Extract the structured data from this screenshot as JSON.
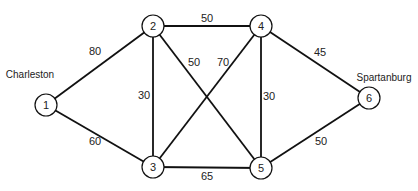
{
  "diagram": {
    "type": "weighted-undirected-graph",
    "nodes": [
      {
        "id": "1",
        "label": "1",
        "x": 46,
        "y": 105,
        "city": "Charleston",
        "city_x": 30,
        "city_y": 74
      },
      {
        "id": "2",
        "label": "2",
        "x": 153,
        "y": 26
      },
      {
        "id": "3",
        "label": "3",
        "x": 153,
        "y": 167
      },
      {
        "id": "4",
        "label": "4",
        "x": 261,
        "y": 26
      },
      {
        "id": "5",
        "label": "5",
        "x": 261,
        "y": 168
      },
      {
        "id": "6",
        "label": "6",
        "x": 369,
        "y": 98,
        "city": "Spartanburg",
        "city_x": 384,
        "city_y": 77
      }
    ],
    "edges": [
      {
        "from": "1",
        "to": "2",
        "weight": "80",
        "label_x": 95,
        "label_y": 51
      },
      {
        "from": "1",
        "to": "3",
        "weight": "60",
        "label_x": 95,
        "label_y": 141
      },
      {
        "from": "2",
        "to": "4",
        "weight": "50",
        "label_x": 207,
        "label_y": 18
      },
      {
        "from": "2",
        "to": "3",
        "weight": "30",
        "label_x": 144,
        "label_y": 95
      },
      {
        "from": "2",
        "to": "5",
        "weight": "50",
        "label_x": 194,
        "label_y": 62
      },
      {
        "from": "4",
        "to": "3",
        "weight": "70",
        "label_x": 223,
        "label_y": 62
      },
      {
        "from": "4",
        "to": "5",
        "weight": "30",
        "label_x": 269,
        "label_y": 96
      },
      {
        "from": "4",
        "to": "6",
        "weight": "45",
        "label_x": 320,
        "label_y": 52
      },
      {
        "from": "3",
        "to": "5",
        "weight": "65",
        "label_x": 207,
        "label_y": 176
      },
      {
        "from": "5",
        "to": "6",
        "weight": "50",
        "label_x": 321,
        "label_y": 141
      }
    ],
    "colors": {
      "stroke": "#111111",
      "text": "#222222",
      "background": "#ffffff"
    }
  }
}
